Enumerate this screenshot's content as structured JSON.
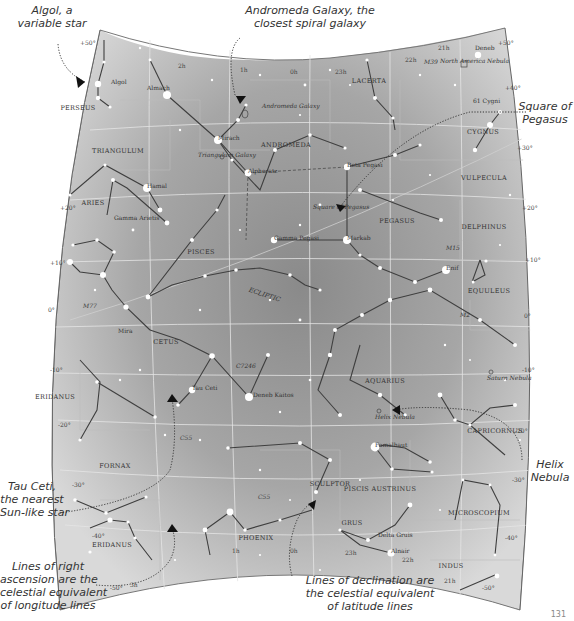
{
  "chart_data": {
    "type": "star_map",
    "title": "",
    "constellations": [
      {
        "name": "PERSEUS",
        "x": 78,
        "y": 110
      },
      {
        "name": "TRIANGULUM",
        "x": 118,
        "y": 153
      },
      {
        "name": "ANDROMEDA",
        "x": 286,
        "y": 147
      },
      {
        "name": "LACERTA",
        "x": 369,
        "y": 83
      },
      {
        "name": "CYGNUS",
        "x": 483,
        "y": 134
      },
      {
        "name": "VULPECULA",
        "x": 484,
        "y": 180
      },
      {
        "name": "ARIES",
        "x": 93,
        "y": 205
      },
      {
        "name": "PEGASUS",
        "x": 397,
        "y": 223
      },
      {
        "name": "DELPHINUS",
        "x": 484,
        "y": 229
      },
      {
        "name": "PISCES",
        "x": 201,
        "y": 254
      },
      {
        "name": "EQUULEUS",
        "x": 489,
        "y": 293
      },
      {
        "name": "CETUS",
        "x": 166,
        "y": 344
      },
      {
        "name": "AQUARIUS",
        "x": 385,
        "y": 383
      },
      {
        "name": "ERIDANUS",
        "x": 55,
        "y": 399
      },
      {
        "name": "CAPRICORNUS",
        "x": 495,
        "y": 433
      },
      {
        "name": "FORNAX",
        "x": 115,
        "y": 468
      },
      {
        "name": "SCULPTOR",
        "x": 330,
        "y": 486
      },
      {
        "name": "PISCIS AUSTRINUS",
        "x": 380,
        "y": 491
      },
      {
        "name": "MICROSCOPIUM",
        "x": 479,
        "y": 515
      },
      {
        "name": "GRUS",
        "x": 352,
        "y": 525
      },
      {
        "name": "ERIDANUS",
        "x": 112,
        "y": 547
      },
      {
        "name": "PHOENIX",
        "x": 256,
        "y": 540
      },
      {
        "name": "INDUS",
        "x": 451,
        "y": 568
      }
    ],
    "named_objects": [
      {
        "name": "Algol",
        "x": 111,
        "y": 84,
        "kind": "star"
      },
      {
        "name": "Almach",
        "x": 147,
        "y": 90,
        "kind": "star"
      },
      {
        "name": "Andromeda Galaxy",
        "x": 262,
        "y": 108,
        "kind": "galaxy"
      },
      {
        "name": "Deneb",
        "x": 475,
        "y": 50,
        "kind": "star"
      },
      {
        "name": "North America Nebula",
        "x": 440,
        "y": 63,
        "kind": "nebula"
      },
      {
        "name": "M39",
        "x": 424,
        "y": 64,
        "kind": "cluster"
      },
      {
        "name": "61 Cygni",
        "x": 473,
        "y": 103,
        "kind": "star"
      },
      {
        "name": "Mirach",
        "x": 218,
        "y": 140,
        "kind": "star"
      },
      {
        "name": "Triangulum Galaxy",
        "x": 198,
        "y": 157,
        "kind": "galaxy"
      },
      {
        "name": "Alpheratz",
        "x": 248,
        "y": 173,
        "kind": "star"
      },
      {
        "name": "Beta Pegasi",
        "x": 347,
        "y": 167,
        "kind": "star"
      },
      {
        "name": "Hamal",
        "x": 147,
        "y": 188,
        "kind": "star"
      },
      {
        "name": "Gamma Arietis",
        "x": 114,
        "y": 220,
        "kind": "star"
      },
      {
        "name": "Square of Pegasus",
        "x": 313,
        "y": 209,
        "kind": "asterism"
      },
      {
        "name": "Gamma Pegasi",
        "x": 274,
        "y": 240,
        "kind": "star"
      },
      {
        "name": "Markab",
        "x": 347,
        "y": 240,
        "kind": "star"
      },
      {
        "name": "M15",
        "x": 446,
        "y": 250,
        "kind": "cluster"
      },
      {
        "name": "Enif",
        "x": 446,
        "y": 270,
        "kind": "star"
      },
      {
        "name": "M2",
        "x": 460,
        "y": 317,
        "kind": "cluster"
      },
      {
        "name": "M77",
        "x": 83,
        "y": 308,
        "kind": "galaxy"
      },
      {
        "name": "Mira",
        "x": 118,
        "y": 333,
        "kind": "star"
      },
      {
        "name": "C7246",
        "x": 236,
        "y": 368,
        "kind": "galaxy"
      },
      {
        "name": "Tau Ceti",
        "x": 192,
        "y": 390,
        "kind": "star"
      },
      {
        "name": "Deneb Kaitos",
        "x": 253,
        "y": 397,
        "kind": "star"
      },
      {
        "name": "Saturn Nebula",
        "x": 487,
        "y": 380,
        "kind": "nebula"
      },
      {
        "name": "Helix Nebula",
        "x": 375,
        "y": 419,
        "kind": "nebula"
      },
      {
        "name": "Fomalhaut",
        "x": 375,
        "y": 447,
        "kind": "star"
      },
      {
        "name": "Delta Gruis",
        "x": 378,
        "y": 537,
        "kind": "star"
      },
      {
        "name": "Alnair",
        "x": 391,
        "y": 553,
        "kind": "star"
      }
    ],
    "declination_labels": [
      "+50°",
      "+40°",
      "+30°",
      "+20°",
      "+10°",
      "0°",
      "-10°",
      "-20°",
      "-30°",
      "-40°",
      "-50°"
    ],
    "right_ascension_labels": [
      "2h",
      "1h",
      "0h",
      "23h",
      "22h",
      "21h",
      "3h"
    ],
    "ecliptic_label": "ECLIPTIC"
  },
  "map": {
    "bg_light": "#dcdcdc",
    "bg_dark": "#8e8e8e",
    "line_color": "#4a4a4a",
    "grid_color": "#e8e8e8",
    "star_color": "#ffffff",
    "text_color": "#333333"
  },
  "callouts": {
    "algol": [
      "Algol, a",
      "variable star"
    ],
    "andromeda": [
      "Andromeda Galaxy, the",
      "closest spiral galaxy"
    ],
    "square": [
      "Square of",
      "Pegasus"
    ],
    "helix": [
      "Helix",
      "Nebula"
    ],
    "tauceti": [
      "Tau Ceti,",
      "the nearest",
      "Sun-like star"
    ],
    "ra_lines": [
      "Lines of right",
      "ascension are the",
      "celestial equivalent",
      "of longitude lines"
    ],
    "dec_lines": [
      "Lines of declination are",
      "the celestial equivalent",
      "of latitude lines"
    ]
  },
  "page_number": "131"
}
